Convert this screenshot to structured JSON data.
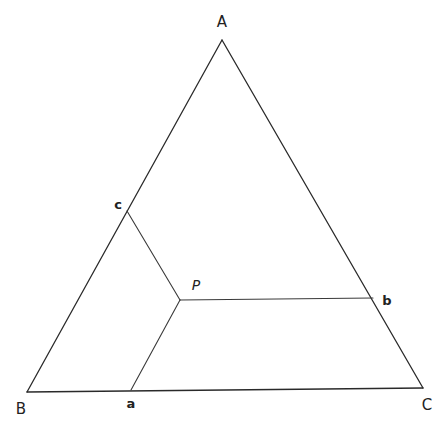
{
  "diagram": {
    "type": "ternary-triangle",
    "colors": {
      "stroke": "#2a2a2a",
      "background": "#ffffff",
      "text": "#222222"
    },
    "vertices": {
      "A": {
        "label": "A",
        "x": 222,
        "y": 40
      },
      "B": {
        "label": "B",
        "x": 27,
        "y": 392
      },
      "C": {
        "label": "C",
        "x": 423,
        "y": 388
      }
    },
    "interior_point": {
      "label": "P",
      "x": 180,
      "y": 300
    },
    "foot_points": {
      "a": {
        "label": "a",
        "x": 131,
        "y": 390,
        "on_side": "BC"
      },
      "b": {
        "label": "b",
        "x": 373,
        "y": 298,
        "on_side": "AC"
      },
      "c": {
        "label": "c",
        "x": 127,
        "y": 211,
        "on_side": "AB"
      }
    },
    "segments": [
      {
        "from": "A",
        "to": "B"
      },
      {
        "from": "B",
        "to": "C"
      },
      {
        "from": "C",
        "to": "A"
      },
      {
        "from": "P",
        "to": "a"
      },
      {
        "from": "P",
        "to": "b"
      },
      {
        "from": "P",
        "to": "c"
      }
    ]
  }
}
